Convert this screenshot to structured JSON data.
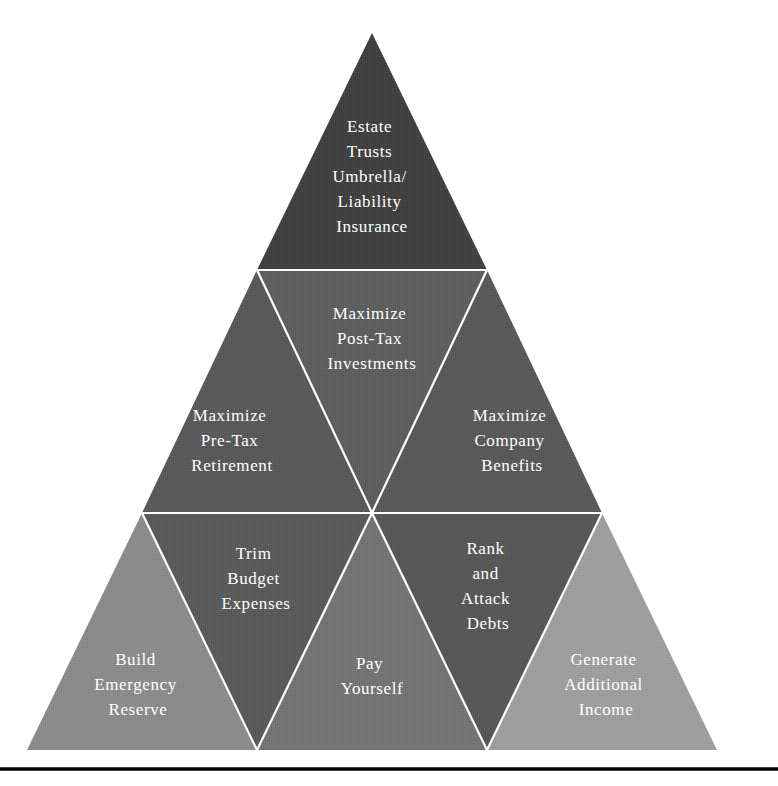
{
  "diagram": {
    "type": "pyramid",
    "shape": "triangle",
    "background_color": "#ffffff",
    "line_color": "#fdfdfd",
    "text_color": "#ffffff",
    "baseline_rule_color": "#000000",
    "geometry": {
      "apex_x": 372,
      "apex_y": 33,
      "base_y": 750,
      "base_left_x": 22,
      "base_right_x": 722,
      "tier_divider_1_y": 270,
      "tier_divider_2_y": 513,
      "baseline_rule_y": 769
    },
    "tiers": [
      {
        "index": 1,
        "name": "top-tier",
        "fill": "#3f3f3f",
        "segments": [
          {
            "id": "estate-planning",
            "orientation": "upright",
            "fill": "#3f3f3f",
            "lines": [
              "Estate",
              "Trusts",
              "Umbrella/",
              "Liability",
              "Insurance"
            ],
            "label_x": 372,
            "label_y": 150
          }
        ]
      },
      {
        "index": 2,
        "name": "middle-tier",
        "fill": "#585858",
        "segments": [
          {
            "id": "maximize-pre-tax-retirement",
            "orientation": "upright",
            "fill": "#585858",
            "lines": [
              "Maximize",
              "Pre-Tax",
              "Retirement"
            ],
            "label_x": 232,
            "label_y": 438
          },
          {
            "id": "maximize-post-tax-investments",
            "orientation": "inverted",
            "fill": "#5d5d5d",
            "lines": [
              "Maximize",
              "Post-Tax",
              "Investments"
            ],
            "label_x": 372,
            "label_y": 337
          },
          {
            "id": "maximize-company-benefits",
            "orientation": "upright",
            "fill": "#585858",
            "lines": [
              "Maximize",
              "Company",
              "Benefits"
            ],
            "label_x": 512,
            "label_y": 438
          }
        ]
      },
      {
        "index": 3,
        "name": "bottom-tier",
        "fill": "#8a8a8a",
        "segments": [
          {
            "id": "build-emergency-reserve",
            "orientation": "upright",
            "fill": "#8b8b8b",
            "lines": [
              "Build",
              "Emergency",
              "Reserve"
            ],
            "label_x": 138,
            "label_y": 682
          },
          {
            "id": "trim-budget-expenses",
            "orientation": "inverted",
            "fill": "#595959",
            "lines": [
              "Trim",
              "Budget",
              "Expenses"
            ],
            "label_x": 256,
            "label_y": 578
          },
          {
            "id": "pay-yourself",
            "orientation": "upright",
            "fill": "#737373",
            "lines": [
              "Pay",
              "Yourself"
            ],
            "label_x": 372,
            "label_y": 678
          },
          {
            "id": "rank-and-attack-debts",
            "orientation": "inverted",
            "fill": "#565656",
            "lines": [
              "Rank",
              "and",
              "Attack",
              "Debts"
            ],
            "label_x": 488,
            "label_y": 580
          },
          {
            "id": "generate-additional-income",
            "orientation": "upright",
            "fill": "#9e9e9e",
            "lines": [
              "Generate",
              "Additional",
              "Income"
            ],
            "label_x": 606,
            "label_y": 682
          }
        ]
      }
    ]
  }
}
